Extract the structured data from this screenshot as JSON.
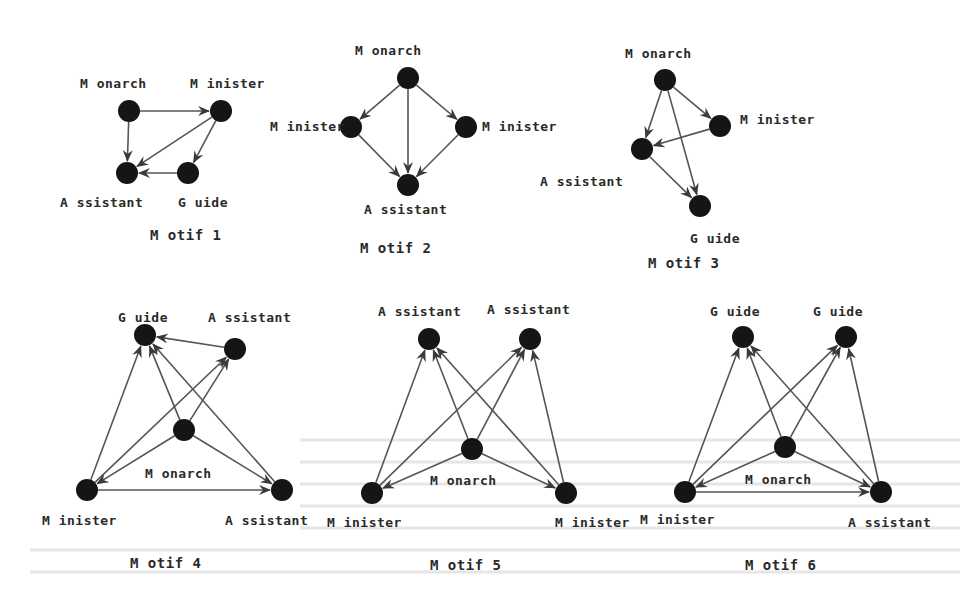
{
  "figure": {
    "colors": {
      "background": "#ffffff",
      "node": "#151515",
      "edge": "#555555",
      "text": "#2a2a2a"
    },
    "motifs": [
      {
        "caption": "M otif 1",
        "caption_pos": [
          150,
          240
        ],
        "nodes": [
          {
            "id": "monarch",
            "label": "M onarch",
            "x": 129,
            "y": 111,
            "lx": 80,
            "ly": 88
          },
          {
            "id": "minister",
            "label": "M inister",
            "x": 221,
            "y": 111,
            "lx": 190,
            "ly": 88
          },
          {
            "id": "assistant",
            "label": "A ssistant",
            "x": 127,
            "y": 173,
            "lx": 60,
            "ly": 207
          },
          {
            "id": "guide",
            "label": "G uide",
            "x": 188,
            "y": 173,
            "lx": 178,
            "ly": 207
          }
        ],
        "edges": [
          [
            "monarch",
            "minister"
          ],
          [
            "monarch",
            "assistant"
          ],
          [
            "minister",
            "assistant"
          ],
          [
            "minister",
            "guide"
          ],
          [
            "guide",
            "assistant"
          ]
        ]
      },
      {
        "caption": "M otif 2",
        "caption_pos": [
          360,
          253
        ],
        "nodes": [
          {
            "id": "monarch",
            "label": "M onarch",
            "x": 408,
            "y": 78,
            "lx": 355,
            "ly": 55
          },
          {
            "id": "minister_l",
            "label": "M inister",
            "x": 351,
            "y": 127,
            "lx": 270,
            "ly": 131
          },
          {
            "id": "minister_r",
            "label": "M inister",
            "x": 466,
            "y": 127,
            "lx": 482,
            "ly": 131
          },
          {
            "id": "assistant",
            "label": "A ssistant",
            "x": 408,
            "y": 185,
            "lx": 364,
            "ly": 214
          }
        ],
        "edges": [
          [
            "monarch",
            "minister_l"
          ],
          [
            "monarch",
            "minister_r"
          ],
          [
            "monarch",
            "assistant"
          ],
          [
            "minister_l",
            "assistant"
          ],
          [
            "minister_r",
            "assistant"
          ]
        ]
      },
      {
        "caption": "M otif 3",
        "caption_pos": [
          648,
          268
        ],
        "nodes": [
          {
            "id": "monarch",
            "label": "M onarch",
            "x": 665,
            "y": 80,
            "lx": 625,
            "ly": 58
          },
          {
            "id": "minister",
            "label": "M inister",
            "x": 720,
            "y": 126,
            "lx": 740,
            "ly": 124
          },
          {
            "id": "assistant",
            "label": "A ssistant",
            "x": 642,
            "y": 149,
            "lx": 540,
            "ly": 186
          },
          {
            "id": "guide",
            "label": "G uide",
            "x": 700,
            "y": 206,
            "lx": 690,
            "ly": 243
          }
        ],
        "edges": [
          [
            "monarch",
            "minister"
          ],
          [
            "monarch",
            "assistant"
          ],
          [
            "monarch",
            "guide"
          ],
          [
            "minister",
            "assistant"
          ],
          [
            "assistant",
            "guide"
          ]
        ]
      },
      {
        "caption": "M otif 4",
        "caption_pos": [
          130,
          568
        ],
        "nodes": [
          {
            "id": "guide",
            "label": "G uide",
            "x": 145,
            "y": 335,
            "lx": 118,
            "ly": 322
          },
          {
            "id": "assistant_top",
            "label": "A ssistant",
            "x": 235,
            "y": 349,
            "lx": 208,
            "ly": 322
          },
          {
            "id": "monarch",
            "label": "M onarch",
            "x": 184,
            "y": 430,
            "lx": 145,
            "ly": 478
          },
          {
            "id": "minister",
            "label": "M inister",
            "x": 87,
            "y": 490,
            "lx": 42,
            "ly": 525
          },
          {
            "id": "assistant_br",
            "label": "A ssistant",
            "x": 282,
            "y": 490,
            "lx": 225,
            "ly": 525
          }
        ],
        "edges": [
          [
            "assistant_top",
            "guide"
          ],
          [
            "minister",
            "guide"
          ],
          [
            "minister",
            "assistant_top"
          ],
          [
            "minister",
            "assistant_br"
          ],
          [
            "monarch",
            "guide"
          ],
          [
            "monarch",
            "assistant_top"
          ],
          [
            "monarch",
            "minister"
          ],
          [
            "monarch",
            "assistant_br"
          ],
          [
            "assistant_br",
            "guide"
          ]
        ]
      },
      {
        "caption": "M otif 5",
        "caption_pos": [
          430,
          570
        ],
        "nodes": [
          {
            "id": "assistant_l",
            "label": "A ssistant",
            "x": 429,
            "y": 339,
            "lx": 378,
            "ly": 316
          },
          {
            "id": "assistant_r",
            "label": "A ssistant",
            "x": 530,
            "y": 339,
            "lx": 487,
            "ly": 314
          },
          {
            "id": "monarch",
            "label": "M onarch",
            "x": 472,
            "y": 449,
            "lx": 430,
            "ly": 485
          },
          {
            "id": "minister_l",
            "label": "M inister",
            "x": 372,
            "y": 493,
            "lx": 327,
            "ly": 527
          },
          {
            "id": "minister_r",
            "label": "M inister",
            "x": 566,
            "y": 493,
            "lx": 555,
            "ly": 527
          }
        ],
        "edges": [
          [
            "minister_l",
            "assistant_l"
          ],
          [
            "minister_l",
            "assistant_r"
          ],
          [
            "minister_r",
            "assistant_l"
          ],
          [
            "minister_r",
            "assistant_r"
          ],
          [
            "monarch",
            "assistant_l"
          ],
          [
            "monarch",
            "assistant_r"
          ],
          [
            "monarch",
            "minister_l"
          ],
          [
            "monarch",
            "minister_r"
          ]
        ]
      },
      {
        "caption": "M otif 6",
        "caption_pos": [
          745,
          570
        ],
        "nodes": [
          {
            "id": "guide_l",
            "label": "G uide",
            "x": 743,
            "y": 337,
            "lx": 710,
            "ly": 316
          },
          {
            "id": "guide_r",
            "label": "G uide",
            "x": 846,
            "y": 337,
            "lx": 813,
            "ly": 316
          },
          {
            "id": "monarch",
            "label": "M onarch",
            "x": 785,
            "y": 447,
            "lx": 745,
            "ly": 484
          },
          {
            "id": "minister",
            "label": "M inister",
            "x": 685,
            "y": 492,
            "lx": 640,
            "ly": 524
          },
          {
            "id": "assistant",
            "label": "A ssistant",
            "x": 881,
            "y": 492,
            "lx": 848,
            "ly": 527
          }
        ],
        "edges": [
          [
            "minister",
            "guide_l"
          ],
          [
            "minister",
            "guide_r"
          ],
          [
            "minister",
            "assistant"
          ],
          [
            "assistant",
            "guide_l"
          ],
          [
            "assistant",
            "guide_r"
          ],
          [
            "monarch",
            "guide_l"
          ],
          [
            "monarch",
            "guide_r"
          ],
          [
            "monarch",
            "minister"
          ],
          [
            "monarch",
            "assistant"
          ]
        ]
      }
    ],
    "node_radius": 11
  }
}
